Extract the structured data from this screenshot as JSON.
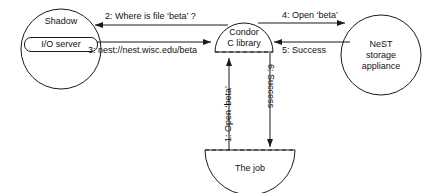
{
  "diagram": {
    "background_color": "#ffffff",
    "stroke_color": "#1a1a1a",
    "nodes": [
      {
        "id": "shadow",
        "shape": "circle",
        "label": "Shadow",
        "inner_label": "I/O server"
      },
      {
        "id": "condor",
        "shape": "dome",
        "label_line1": "Condor",
        "label_line2": "C library"
      },
      {
        "id": "nest",
        "shape": "circle",
        "label_line1": "NeST",
        "label_line2": "storage",
        "label_line3": "appliance"
      },
      {
        "id": "job",
        "shape": "bowl",
        "label": "The job"
      }
    ],
    "edges": [
      {
        "id": "edge-2",
        "label": "2: Where is file ‘beta’ ?",
        "from": "condor",
        "to": "shadow",
        "direction": "left"
      },
      {
        "id": "edge-3",
        "label": "3: nest://nest.wisc.edu/beta",
        "from": "shadow",
        "to": "condor",
        "direction": "right"
      },
      {
        "id": "edge-4",
        "label": "4: Open ‘beta’",
        "from": "condor",
        "to": "nest",
        "direction": "right"
      },
      {
        "id": "edge-5",
        "label": "5: Success",
        "from": "nest",
        "to": "condor",
        "direction": "left"
      },
      {
        "id": "edge-1",
        "label": "1: Open ‘beta’",
        "from": "job",
        "to": "condor",
        "direction": "up"
      },
      {
        "id": "edge-6",
        "label": "6: Success",
        "from": "condor",
        "to": "job",
        "direction": "down"
      }
    ]
  }
}
